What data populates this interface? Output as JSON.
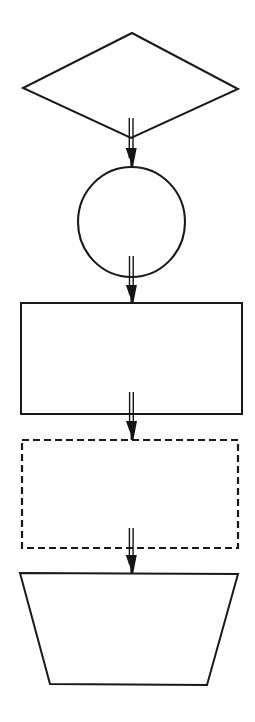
{
  "diagram": {
    "orientation": "vertical top-to-bottom",
    "background_color": "#ffffff",
    "stroke_color": "#1a1a1a",
    "fill_color": "#ffffff",
    "node_count": 5,
    "connector_count": 4,
    "nodes": [
      {
        "id": "node-1",
        "shape": "diamond",
        "label": "",
        "border_style": "solid",
        "fill": "#ffffff",
        "stroke": "#1a1a1a",
        "center": [
          131,
          86
        ],
        "width": 215,
        "height": 105
      },
      {
        "id": "node-2",
        "shape": "circle",
        "label": "",
        "border_style": "solid",
        "fill": "#ffffff",
        "stroke": "#1a1a1a",
        "center": [
          131,
          222
        ],
        "width": 107,
        "height": 110
      },
      {
        "id": "node-3",
        "shape": "rectangle",
        "label": "",
        "border_style": "solid",
        "fill": "#ffffff",
        "stroke": "#1a1a1a",
        "center": [
          131,
          358
        ],
        "width": 221,
        "height": 111
      },
      {
        "id": "node-4",
        "shape": "rectangle",
        "label": "",
        "border_style": "dashed",
        "fill": "#ffffff",
        "stroke": "#1a1a1a",
        "center": [
          130,
          494
        ],
        "width": 216,
        "height": 108
      },
      {
        "id": "node-5",
        "shape": "inverted-trapezoid",
        "label": "",
        "border_style": "solid",
        "fill": "#ffffff",
        "stroke": "#1a1a1a",
        "center": [
          129,
          629
        ],
        "top_width": 218,
        "bottom_width": 157,
        "height": 112
      }
    ],
    "connectors": [
      {
        "id": "connector-1",
        "from": "node-1",
        "to": "node-2",
        "style": "double-line",
        "arrowhead": "filled-triangle",
        "label": ""
      },
      {
        "id": "connector-2",
        "from": "node-2",
        "to": "node-3",
        "style": "double-line",
        "arrowhead": "filled-triangle",
        "label": ""
      },
      {
        "id": "connector-3",
        "from": "node-3",
        "to": "node-4",
        "style": "double-line",
        "arrowhead": "filled-triangle",
        "label": ""
      },
      {
        "id": "connector-4",
        "from": "node-4",
        "to": "node-5",
        "style": "double-line",
        "arrowhead": "filled-triangle",
        "label": ""
      }
    ]
  }
}
